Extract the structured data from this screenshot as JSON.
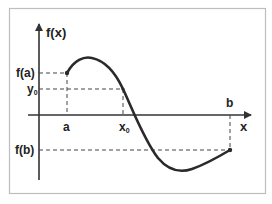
{
  "diagram": {
    "axes": {
      "y_label": "f(x)",
      "x_label": "x"
    },
    "x_labels": {
      "a": "a",
      "x0_main": "x",
      "x0_sub": "0",
      "b": "b"
    },
    "y_labels": {
      "fa": "f(a)",
      "y0_main": "y",
      "y0_sub": "0",
      "fb": "f(b)"
    },
    "colors": {
      "curve": "#2a2a2a",
      "axis": "#333333",
      "dash": "#444444",
      "frame": "#bdbdbd",
      "text": "#222222"
    }
  }
}
